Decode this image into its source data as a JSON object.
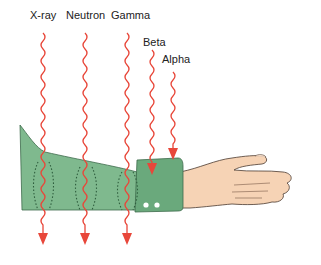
{
  "diagram": {
    "colors": {
      "ray": "#e8473a",
      "sleeve": "#7fb98e",
      "sleeve_dark": "#2f5e3e",
      "cuff": "#6aa97c",
      "skin": "#f6d3b5",
      "outline": "#4a3a30",
      "button": "#ffffff"
    },
    "rays": [
      {
        "label": "X-ray",
        "x": 43,
        "label_x": 30,
        "label_y": 29,
        "stops_at": "passes through"
      },
      {
        "label": "Neutron",
        "x": 85,
        "label_x": 66,
        "label_y": 29,
        "stops_at": "passes through"
      },
      {
        "label": "Gamma",
        "x": 127,
        "label_x": 111,
        "label_y": 29,
        "stops_at": "passes through"
      },
      {
        "label": "Beta",
        "x": 152,
        "label_x": 143,
        "label_y": 46,
        "stops_at": "skin/tissue"
      },
      {
        "label": "Alpha",
        "x": 173,
        "label_x": 164,
        "label_y": 63,
        "stops_at": "clothing surface"
      }
    ]
  }
}
